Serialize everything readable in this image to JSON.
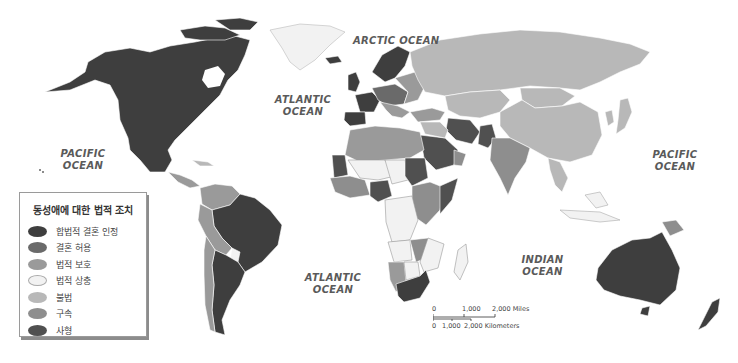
{
  "legend": {
    "title": "동성애에 대한 법적 조치",
    "items": [
      {
        "label": "합법적 결혼 인정",
        "color": "#3e3e3e"
      },
      {
        "label": "결혼 허용",
        "color": "#6a6a6a"
      },
      {
        "label": "법적 보호",
        "color": "#9a9a9a"
      },
      {
        "label": "법적 상충",
        "color": "#f2f2f2"
      },
      {
        "label": "불법",
        "color": "#b8b8b8"
      },
      {
        "label": "구속",
        "color": "#8e8e8e"
      },
      {
        "label": "사형",
        "color": "#505050"
      }
    ]
  },
  "oceans": {
    "arctic": "ARCTIC OCEAN",
    "atlantic_north_1": "ATLANTIC",
    "atlantic_north_2": "OCEAN",
    "pacific_west_1": "PACIFIC",
    "pacific_west_2": "OCEAN",
    "pacific_east_1": "PACIFIC",
    "pacific_east_2": "OCEAN",
    "atlantic_south_1": "ATLANTIC",
    "atlantic_south_2": "OCEAN",
    "indian_1": "INDIAN",
    "indian_2": "OCEAN"
  },
  "scale": {
    "miles_0": "0",
    "miles_1": "1,000",
    "miles_2": "2,000 Miles",
    "km_0": "0",
    "km_1": "1,000",
    "km_2": "2,000 Kilometers"
  },
  "colors": {
    "marriage": "#3e3e3e",
    "union": "#6a6a6a",
    "protection": "#9a9a9a",
    "mixed": "#f2f2f2",
    "illegal": "#b8b8b8",
    "prison": "#8e8e8e",
    "death": "#505050",
    "ocean": "#ffffff"
  }
}
